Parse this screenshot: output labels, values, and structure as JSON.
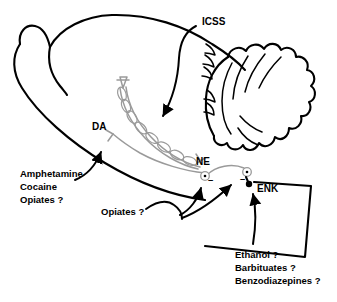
{
  "figure": {
    "background_color": "#ffffff",
    "ink_color": "#000000",
    "pathway_color": "#9a9a9a",
    "width": 337,
    "height": 302
  },
  "pathway_labels": {
    "icss": "ICSS",
    "da": "DA",
    "ne": "NE",
    "enk": "ENK"
  },
  "signs": {
    "ne_terminal": "–",
    "enk_terminal": "–"
  },
  "drug_blocks": {
    "left": {
      "name": "psychostimulant-block",
      "lines": [
        "Amphetamine",
        "Cocaine",
        "Opiates ?"
      ]
    },
    "middle": {
      "name": "opiate-block",
      "lines": [
        "Opiates ?"
      ]
    },
    "right": {
      "name": "depressant-block",
      "lines": [
        "Ethanol ?",
        "Barbituates ?",
        "Benzodiazepines ?"
      ]
    }
  },
  "anatomy_parts": {
    "cortex": "cerebral-cortex-outline",
    "olfactory_bulb": "olfactory-bulb-outline",
    "cerebellum": "cerebellum-outline",
    "brainstem": "brainstem-outline"
  }
}
